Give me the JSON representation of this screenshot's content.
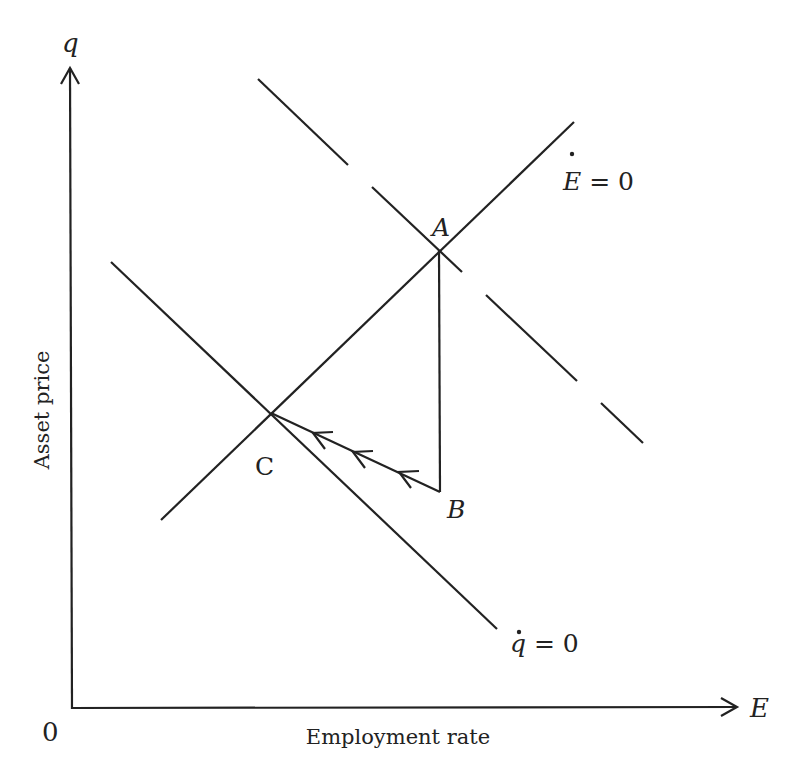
{
  "figure": {
    "type": "phase-diagram",
    "colors": {
      "ink": "#222222",
      "background": "#ffffff"
    },
    "axes": {
      "x": {
        "symbol": "E",
        "label": "Employment rate"
      },
      "y": {
        "symbol": "q",
        "label": "Asset price"
      },
      "origin_label": "0"
    },
    "curves": {
      "e_dot_zero": {
        "label_var": "E",
        "label_rest": " = 0",
        "style": "solid",
        "slope": "upward"
      },
      "q_dot_zero_initial": {
        "label_var": "q",
        "label_rest": " = 0",
        "style": "solid",
        "slope": "downward"
      },
      "q_dot_zero_shifted": {
        "style": "dashed",
        "slope": "downward"
      }
    },
    "points": [
      {
        "id": "A",
        "label": "A",
        "description": "intersection of Ė=0 and dashed q̇=0 (initial equilibrium)"
      },
      {
        "id": "B",
        "label": "B",
        "description": "point directly below A after vertical jump in q"
      },
      {
        "id": "C",
        "label": "C",
        "description": "intersection of Ė=0 and solid q̇=0 (new equilibrium)"
      }
    ],
    "paths": [
      {
        "from": "A",
        "to": "B",
        "style": "vertical jump"
      },
      {
        "from": "B",
        "to": "C",
        "style": "saddle path",
        "arrowheads": 3
      }
    ]
  }
}
